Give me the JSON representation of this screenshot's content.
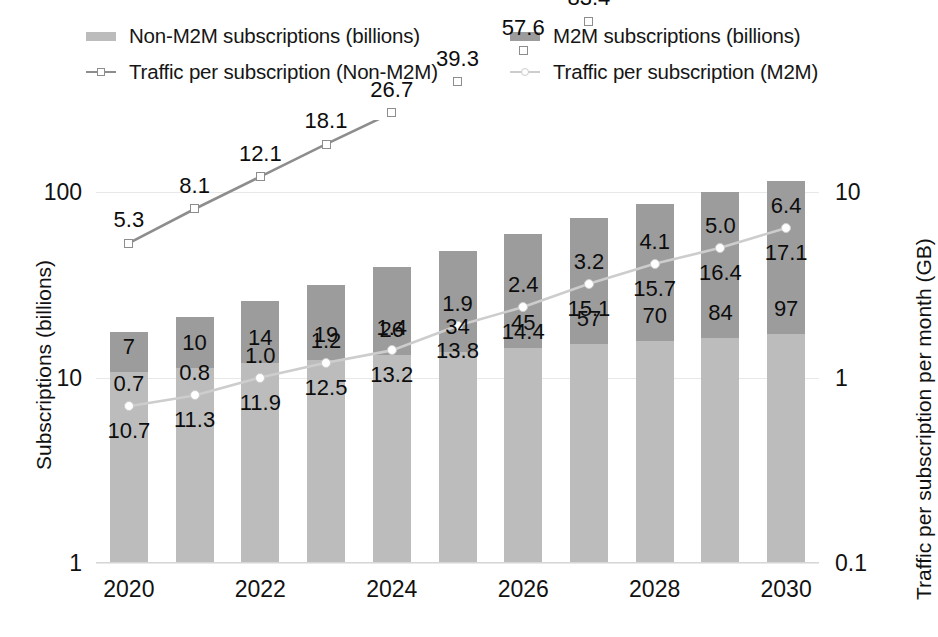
{
  "legend": {
    "items": [
      {
        "label": "Non-M2M subscriptions (billions)",
        "marker": "bar-swatch",
        "color": "#bcbcbc"
      },
      {
        "label": "M2M subscriptions (billions)",
        "marker": "bar-swatch",
        "color": "#9c9c9c"
      },
      {
        "label": "Traffic per subscription (Non-M2M)",
        "marker": "line-square-marker",
        "color": "#8d8d8d"
      },
      {
        "label": "Traffic per subscription (M2M)",
        "marker": "line-circle-marker",
        "color": "#cdcdcd"
      }
    ]
  },
  "chart_data": {
    "type": "bar",
    "title": "",
    "subtitle": "",
    "xlabel": "",
    "ylabel": "Subscriptions (billions)",
    "y2label": "Traffic per subscription per month (GB)",
    "grid": true,
    "legend_position": "top",
    "yscale": "log",
    "y2scale": "log",
    "ylim": [
      1,
      200
    ],
    "y2lim": [
      0.1,
      200
    ],
    "yticks": [
      "1",
      "10",
      "100"
    ],
    "ytick_values": [
      1,
      10,
      100
    ],
    "y2ticks": [
      "0.1",
      "1",
      "10",
      "100"
    ],
    "y2tick_values": [
      0.1,
      1,
      10,
      100
    ],
    "x": [
      2020,
      2021,
      2022,
      2023,
      2024,
      2025,
      2026,
      2027,
      2028,
      2029,
      2030
    ],
    "categories": [
      "2020",
      "2021",
      "2022",
      "2023",
      "2024",
      "2025",
      "2026",
      "2027",
      "2028",
      "2029",
      "2030"
    ],
    "xtick_labels": [
      "2020",
      "2022",
      "2024",
      "2026",
      "2028",
      "2030"
    ],
    "xtick_values": [
      2020,
      2022,
      2024,
      2026,
      2028,
      2030
    ],
    "series": [
      {
        "name": "Non-M2M subscriptions (billions)",
        "kind": "bar-stack-bottom",
        "axis": "left",
        "color": "#bcbcbc",
        "values": [
          10.7,
          11.3,
          11.9,
          12.5,
          13.2,
          13.8,
          14.4,
          15.1,
          15.7,
          16.4,
          17.1
        ],
        "labels": [
          "10.7",
          "11.3",
          "11.9",
          "12.5",
          "13.2",
          "13.8",
          "14.4",
          "15.1",
          "15.7",
          "16.4",
          "17.1"
        ]
      },
      {
        "name": "M2M subscriptions (billions)",
        "kind": "bar-stack-top",
        "axis": "left",
        "color": "#9c9c9c",
        "values": [
          7,
          10,
          14,
          19,
          26,
          34,
          45,
          57,
          70,
          84,
          97
        ],
        "labels": [
          "7",
          "10",
          "14",
          "19",
          "26",
          "34",
          "45",
          "57",
          "70",
          "84",
          "97"
        ]
      },
      {
        "name": "Traffic per subscription (Non-M2M)",
        "kind": "line",
        "axis": "right",
        "color": "#8d8d8d",
        "marker": "square",
        "values": [
          5.3,
          8.1,
          12.1,
          18.1,
          26.7,
          39.3,
          57.6,
          83.4,
          121.7,
          177.1,
          257.0
        ],
        "labels": [
          "5.3",
          "8.1",
          "12.1",
          "18.1",
          "26.7",
          "39.3",
          "57.6",
          "83.4",
          "121.7",
          "177.1",
          "257.0"
        ]
      },
      {
        "name": "Traffic per subscription (M2M)",
        "kind": "line",
        "axis": "right",
        "color": "#cdcdcd",
        "marker": "circle",
        "values": [
          0.7,
          0.8,
          1.0,
          1.2,
          1.4,
          1.9,
          2.4,
          3.2,
          4.1,
          5.0,
          6.4
        ],
        "labels": [
          "0.7",
          "0.8",
          "1.0",
          "1.2",
          "1.4",
          "1.9",
          "2.4",
          "3.2",
          "4.1",
          "5.0",
          "6.4"
        ]
      }
    ]
  }
}
